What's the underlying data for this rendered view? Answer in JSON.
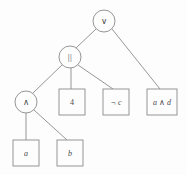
{
  "figure": {
    "kind": "expression-tree",
    "colors": {
      "stroke": "#8a8a8a",
      "text": "#4a4a4a",
      "background": "#fdfdfd"
    }
  },
  "nodes": {
    "root": {
      "id": "root",
      "label": "∨",
      "shape": "circle",
      "cx": 104,
      "cy": 21,
      "r": 11
    },
    "or_bars": {
      "id": "or_bars",
      "label": "||",
      "shape": "circle",
      "cx": 70,
      "cy": 57,
      "r": 11
    },
    "and_circle": {
      "id": "and_circle",
      "label": "∧",
      "shape": "circle",
      "cx": 26,
      "cy": 102,
      "r": 11
    },
    "four": {
      "id": "four",
      "label": "4",
      "shape": "box",
      "x": 59,
      "y": 89,
      "w": 26,
      "h": 26
    },
    "not_c": {
      "id": "not_c",
      "label": "¬ c",
      "shape": "box",
      "x": 103,
      "y": 89,
      "w": 26,
      "h": 26
    },
    "a_and_d": {
      "id": "a_and_d",
      "label": "a ∧ d",
      "shape": "box",
      "x": 147,
      "y": 89,
      "w": 30,
      "h": 26
    },
    "leaf_a": {
      "id": "leaf_a",
      "label": "a",
      "shape": "box",
      "x": 13,
      "y": 140,
      "w": 26,
      "h": 26
    },
    "leaf_b": {
      "id": "leaf_b",
      "label": "b",
      "shape": "box",
      "x": 57,
      "y": 140,
      "w": 26,
      "h": 26
    }
  },
  "edges": [
    {
      "from": "root",
      "to": "or_bars",
      "x1": 96,
      "y1": 29,
      "x2": 76,
      "y2": 48
    },
    {
      "from": "root",
      "to": "a_and_d",
      "x1": 112,
      "y1": 29,
      "x2": 160,
      "y2": 89
    },
    {
      "from": "or_bars",
      "to": "and_circle",
      "x1": 62,
      "y1": 65,
      "x2": 33,
      "y2": 93
    },
    {
      "from": "or_bars",
      "to": "four",
      "x1": 71,
      "y1": 68,
      "x2": 71,
      "y2": 89
    },
    {
      "from": "or_bars",
      "to": "not_c",
      "x1": 78,
      "y1": 65,
      "x2": 113,
      "y2": 89
    },
    {
      "from": "and_circle",
      "to": "leaf_a",
      "x1": 26,
      "y1": 113,
      "x2": 26,
      "y2": 140
    },
    {
      "from": "and_circle",
      "to": "leaf_b",
      "x1": 34,
      "y1": 110,
      "x2": 67,
      "y2": 140
    }
  ]
}
